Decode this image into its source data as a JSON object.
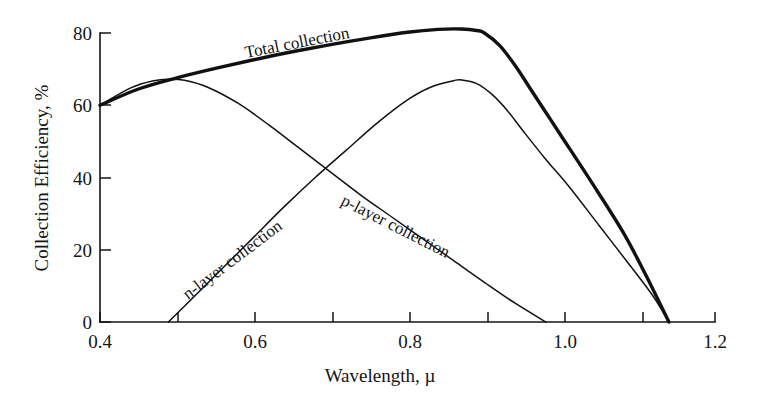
{
  "chart_data": {
    "type": "line",
    "title": "",
    "xlabel": "Wavelength, µ",
    "ylabel": "Collection Efficiency, %",
    "xlim": [
      0.4,
      1.2
    ],
    "ylim": [
      0,
      80
    ],
    "xticks": [
      "0.4",
      "0.6",
      "0.8",
      "1.0",
      "1.2"
    ],
    "xtick_values": [
      0.4,
      0.6,
      0.8,
      1.0,
      1.2
    ],
    "xminor_values": [
      0.5,
      0.7,
      0.9,
      1.1
    ],
    "yticks": [
      "0",
      "20",
      "40",
      "60",
      "80"
    ],
    "ytick_values": [
      0,
      20,
      40,
      60,
      80
    ],
    "grid": false,
    "legend": "inline-curve-labels",
    "series": [
      {
        "name": "Total collection",
        "label": "Total collection",
        "style": "thick",
        "x": [
          0.4,
          0.45,
          0.5,
          0.55,
          0.6,
          0.65,
          0.7,
          0.75,
          0.8,
          0.84,
          0.87,
          0.89,
          0.9,
          0.92,
          0.94,
          0.96,
          0.98,
          1.0,
          1.04,
          1.08,
          1.11,
          1.14
        ],
        "y": [
          60.0,
          64.5,
          67.6,
          70.2,
          72.6,
          74.8,
          76.8,
          78.6,
          80.2,
          81.0,
          81.1,
          80.7,
          80.0,
          76.5,
          71.0,
          64.5,
          58.0,
          51.5,
          38.5,
          25.0,
          13.0,
          0.0
        ]
      },
      {
        "name": "n-layer collection",
        "label": "n-layer collection",
        "style": "thin",
        "x": [
          0.489,
          0.52,
          0.56,
          0.6,
          0.64,
          0.68,
          0.72,
          0.76,
          0.8,
          0.83,
          0.86,
          0.87,
          0.89,
          0.91,
          0.93,
          0.95,
          0.98,
          1.01,
          1.05,
          1.09,
          1.12,
          1.14
        ],
        "y": [
          0.0,
          6.5,
          15.0,
          23.5,
          32.0,
          40.0,
          47.5,
          55.0,
          61.5,
          65.0,
          66.8,
          67.0,
          66.0,
          63.0,
          58.5,
          53.0,
          45.0,
          37.5,
          26.5,
          15.5,
          7.0,
          0.0
        ]
      },
      {
        "name": "p-layer collection",
        "label": "p-layer collection",
        "style": "thin",
        "x": [
          0.4,
          0.44,
          0.47,
          0.49,
          0.51,
          0.54,
          0.58,
          0.62,
          0.66,
          0.7,
          0.74,
          0.78,
          0.82,
          0.86,
          0.9,
          0.94,
          0.98
        ],
        "y": [
          60.0,
          64.8,
          66.8,
          67.2,
          66.9,
          65.0,
          60.5,
          54.5,
          48.0,
          41.5,
          35.0,
          29.0,
          23.0,
          17.0,
          11.0,
          5.2,
          0.0
        ]
      }
    ],
    "annotations": [
      {
        "name": "total-collection-label",
        "text": "Total collection",
        "x_px": 246,
        "y_px": 58,
        "rotation": -11
      },
      {
        "name": "n-layer-collection-label",
        "text": "n-layer collection",
        "x_px": 188,
        "y_px": 300,
        "rotation": -37
      },
      {
        "name": "p-layer-collection-label",
        "text": "p-layer collection",
        "x_px": 340,
        "y_px": 204,
        "rotation": 27
      }
    ]
  }
}
